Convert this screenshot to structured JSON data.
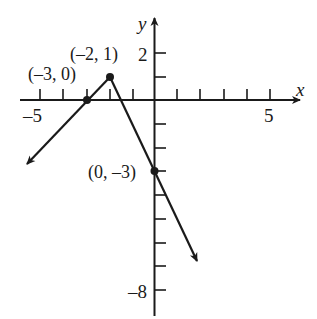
{
  "graph": {
    "axes": {
      "x_label": "x",
      "y_label": "y",
      "x_tick_labels": [
        {
          "value": -5,
          "text": "-5"
        },
        {
          "value": 5,
          "text": "5"
        }
      ],
      "y_tick_labels": [
        {
          "value": 2,
          "text": "2"
        },
        {
          "value": -8,
          "text": "-8"
        }
      ],
      "x_range": [
        -6,
        6
      ],
      "y_range": [
        -9,
        3
      ]
    },
    "points": [
      {
        "label": "(-3, 0)",
        "x": -3,
        "y": 0
      },
      {
        "label": "(-2, 1)",
        "x": -2,
        "y": 1
      },
      {
        "label": "(0, -3)",
        "x": 0,
        "y": -3
      }
    ],
    "segments": [
      {
        "from": "(-3,0) direction",
        "through": [
          "(-3, 0)",
          "(-2, 1)"
        ],
        "arrow": "left-down"
      },
      {
        "from": "(-2, 1)",
        "through": [
          "(0, -3)"
        ],
        "arrow": "right-down"
      }
    ],
    "stroke_color": "#1a1a1a",
    "background": "#ffffff"
  }
}
